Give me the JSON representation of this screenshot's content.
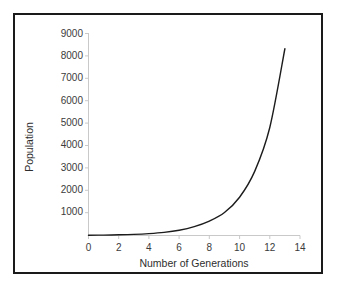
{
  "chart_data": {
    "type": "line",
    "title": "",
    "xlabel": "Number of Generations",
    "ylabel": "Population",
    "xlim": [
      0,
      14
    ],
    "ylim": [
      0,
      9000
    ],
    "grid": false,
    "legend": null,
    "xticks": [
      "0",
      "2",
      "4",
      "6",
      "8",
      "10",
      "12",
      "14"
    ],
    "yticks": [
      "1000",
      "2000",
      "3000",
      "4000",
      "5000",
      "6000",
      "7000",
      "8000",
      "9000"
    ],
    "xtick_values": [
      0,
      2,
      4,
      6,
      8,
      10,
      12,
      14
    ],
    "ytick_values": [
      1000,
      2000,
      3000,
      4000,
      5000,
      6000,
      7000,
      8000,
      9000
    ],
    "series": [
      {
        "name": "Population",
        "color": "#1c1c1c",
        "x": [
          0,
          1,
          2,
          3,
          4,
          5,
          6,
          7,
          8,
          9,
          10,
          11,
          12,
          13
        ],
        "values": [
          10,
          18,
          30,
          50,
          85,
          140,
          235,
          395,
          640,
          1020,
          1700,
          2850,
          4800,
          8300
        ]
      }
    ]
  },
  "axes": {
    "y_title": "Population",
    "x_title": "Number of Generations"
  },
  "colors": {
    "curve": "#1c1c1c",
    "axis": "#c9c9c9",
    "text": "#3b3b3b",
    "border": "#1a1a1a",
    "background": "#ffffff"
  }
}
